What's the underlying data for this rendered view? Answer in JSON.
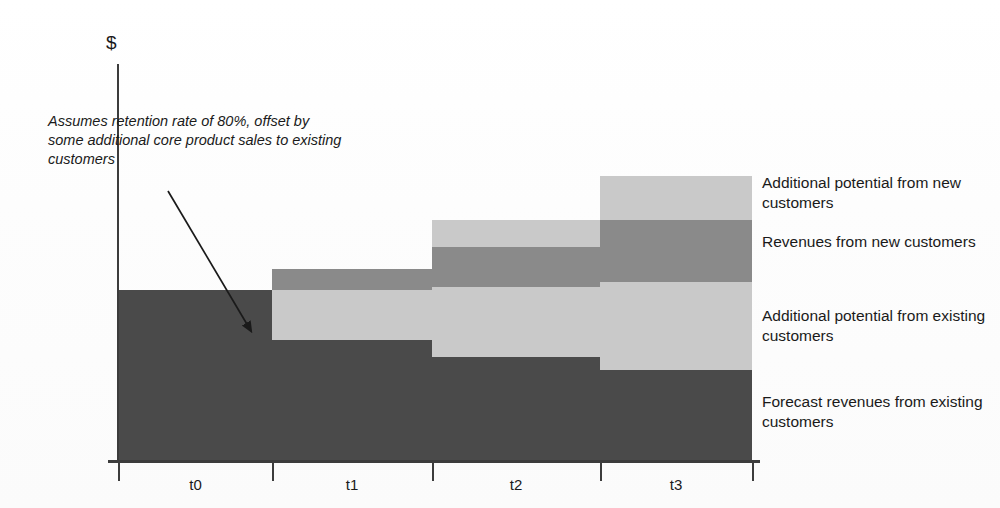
{
  "figure": {
    "y_axis_unit": "$",
    "annotation": "Assumes retention rate of 80%, offset by some additional core product sales to existing customers"
  },
  "legend": {
    "items": [
      {
        "label": "Additional potential from new customers",
        "color": "#c9c9c9",
        "key": "additional_potential_new"
      },
      {
        "label": "Revenues from new customers",
        "color": "#8a8a8a",
        "key": "revenues_new"
      },
      {
        "label": "Additional potential from existing customers",
        "color": "#c9c9c9",
        "key": "additional_potential_existing"
      },
      {
        "label": "Forecast revenues from existing customers",
        "color": "#4a4a4a",
        "key": "forecast_revenues_existing"
      }
    ]
  },
  "chart_data": {
    "type": "bar",
    "title": "",
    "xlabel": "",
    "ylabel": "$",
    "stacked": true,
    "grid": false,
    "legend_position": "right",
    "categories": [
      "t0",
      "t1",
      "t2",
      "t3"
    ],
    "ylim": [
      0,
      100
    ],
    "series": [
      {
        "name": "Forecast revenues from existing customers",
        "color": "#4a4a4a",
        "values": [
          100,
          71,
          61,
          54
        ]
      },
      {
        "name": "Additional potential from existing customers",
        "color": "#c9c9c9",
        "values": [
          0,
          29,
          41,
          51
        ]
      },
      {
        "name": "Revenues from new customers",
        "color": "#8a8a8a",
        "values": [
          0,
          12,
          23,
          36
        ]
      },
      {
        "name": "Additional potential from new customers",
        "color": "#c9c9c9",
        "values": [
          0,
          0,
          16,
          26
        ]
      }
    ],
    "annotations": [
      {
        "text": "Assumes retention rate of 80%, offset by some additional core product sales to existing customers",
        "points_to": "t0/t1 forecast revenue step-down"
      }
    ]
  },
  "geometry": {
    "baseline_y": 462,
    "columns": [
      {
        "name": "t0",
        "x": 119,
        "w": 153,
        "tick_x": 272,
        "label_x": 119,
        "label_w": 153
      },
      {
        "name": "t1",
        "x": 272,
        "w": 160,
        "tick_x": 432,
        "label_x": 272,
        "label_w": 160
      },
      {
        "name": "t2",
        "x": 432,
        "w": 168,
        "tick_x": 600,
        "label_x": 432,
        "label_w": 168
      },
      {
        "name": "t3",
        "x": 600,
        "w": 152,
        "tick_x": 752,
        "label_x": 600,
        "label_w": 152
      }
    ],
    "segments": [
      {
        "col": 0,
        "top": 290,
        "bottom": 462,
        "color": "#4a4a4a",
        "series": "forecast_revenues_existing"
      },
      {
        "col": 1,
        "top": 340,
        "bottom": 462,
        "color": "#4a4a4a",
        "series": "forecast_revenues_existing"
      },
      {
        "col": 1,
        "top": 290,
        "bottom": 340,
        "color": "#c9c9c9",
        "series": "additional_potential_existing"
      },
      {
        "col": 1,
        "top": 269,
        "bottom": 290,
        "color": "#8a8a8a",
        "series": "revenues_new"
      },
      {
        "col": 2,
        "top": 357,
        "bottom": 462,
        "color": "#4a4a4a",
        "series": "forecast_revenues_existing"
      },
      {
        "col": 2,
        "top": 287,
        "bottom": 357,
        "color": "#c9c9c9",
        "series": "additional_potential_existing"
      },
      {
        "col": 2,
        "top": 247,
        "bottom": 287,
        "color": "#8a8a8a",
        "series": "revenues_new"
      },
      {
        "col": 2,
        "top": 220,
        "bottom": 247,
        "color": "#c9c9c9",
        "series": "additional_potential_new"
      },
      {
        "col": 3,
        "top": 370,
        "bottom": 462,
        "color": "#4a4a4a",
        "series": "forecast_revenues_existing"
      },
      {
        "col": 3,
        "top": 282,
        "bottom": 370,
        "color": "#c9c9c9",
        "series": "additional_potential_existing"
      },
      {
        "col": 3,
        "top": 220,
        "bottom": 282,
        "color": "#8a8a8a",
        "series": "revenues_new"
      },
      {
        "col": 3,
        "top": 176,
        "bottom": 220,
        "color": "#c9c9c9",
        "series": "additional_potential_new"
      }
    ],
    "legend_label_positions": [
      {
        "x": 762,
        "y": 173
      },
      {
        "x": 762,
        "y": 232
      },
      {
        "x": 762,
        "y": 306
      },
      {
        "x": 762,
        "y": 392
      }
    ],
    "arrow": {
      "x1": 168,
      "y1": 191,
      "x2": 251,
      "y2": 331
    }
  }
}
